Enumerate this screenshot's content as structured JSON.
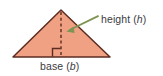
{
  "figure": {
    "type": "geometry-diagram",
    "background_color": "#ffffff",
    "width": 163,
    "height": 76
  },
  "shape": {
    "name": "triangle",
    "fill_color": "#f0a184",
    "stroke_color": "#5c2c20",
    "stroke_width": 1.4,
    "apex": {
      "x": 61,
      "y": 10
    },
    "bottom_left": {
      "x": 13,
      "y": 57
    },
    "bottom_right": {
      "x": 110,
      "y": 57
    }
  },
  "height_line": {
    "name": "altitude",
    "style": "dashed",
    "color": "#5c2c20",
    "from": {
      "x": 61,
      "y": 11
    },
    "to": {
      "x": 61,
      "y": 57
    }
  },
  "right_angle_marker": {
    "color": "#5c2c20",
    "size": 8,
    "corner": {
      "x": 61,
      "y": 57
    },
    "opens": "left"
  },
  "arrow": {
    "color": "#7e9453",
    "from": {
      "x": 98,
      "y": 16
    },
    "to": {
      "x": 67,
      "y": 31
    }
  },
  "labels": {
    "height": {
      "text": "height (",
      "var": "h",
      "suffix": ")"
    },
    "base": {
      "text": "base (",
      "var": "b",
      "suffix": ")"
    }
  },
  "text_color": "#3b3b3f"
}
